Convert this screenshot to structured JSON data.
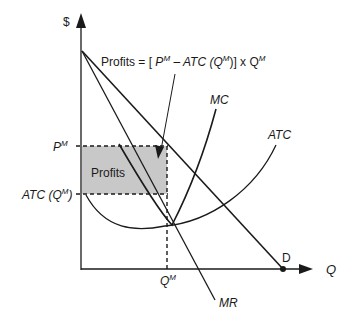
{
  "diagram": {
    "axes": {
      "y_label": "$",
      "x_label": "Q"
    },
    "formula": {
      "prefix": "Profits = [ ",
      "pm_base": "P",
      "pm_sup": "M",
      "minus": " – ATC (Q",
      "q_sup": "M",
      "close": ")] x Q",
      "q2_sup": "M"
    },
    "curves": {
      "mc": "MC",
      "atc": "ATC",
      "mr": "MR",
      "demand": "D"
    },
    "levels": {
      "price_base": "P",
      "price_sup": "M",
      "atc_level_base": "ATC (Q",
      "atc_level_sup": "M",
      "atc_level_close": ")",
      "quantity_base": "Q",
      "quantity_sup": "M"
    },
    "region": {
      "label": "Profits",
      "fill": "#c8c8c8"
    },
    "colors": {
      "line": "#1a1a1a",
      "background": "#ffffff"
    }
  }
}
